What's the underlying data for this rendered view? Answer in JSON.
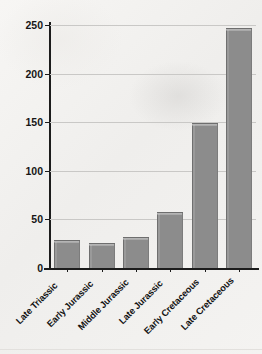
{
  "chart_data": {
    "type": "bar",
    "title": "",
    "xlabel": "",
    "ylabel": "Number of genera (groups)",
    "categories": [
      "Late Triassic",
      "Early Jurassic",
      "Middle Jurassic",
      "Late Jurassic",
      "Early Cretaceous",
      "Late Cretaceous"
    ],
    "values": [
      28,
      25,
      31,
      57,
      148,
      246
    ],
    "ylim": [
      0,
      250
    ],
    "yticks": [
      0,
      50,
      100,
      150,
      200,
      250
    ],
    "ytick_labels": [
      "0",
      "50",
      "100",
      "150",
      "200",
      "250"
    ],
    "grid": "horizontal",
    "legend": "none",
    "bar_color": "#8c8c8c",
    "bar_edge_color": "#6f6f6f",
    "axis_color": "#1c1c1c",
    "gridline_color": "#c9c8c6",
    "background_color": "#f2f1ef"
  }
}
